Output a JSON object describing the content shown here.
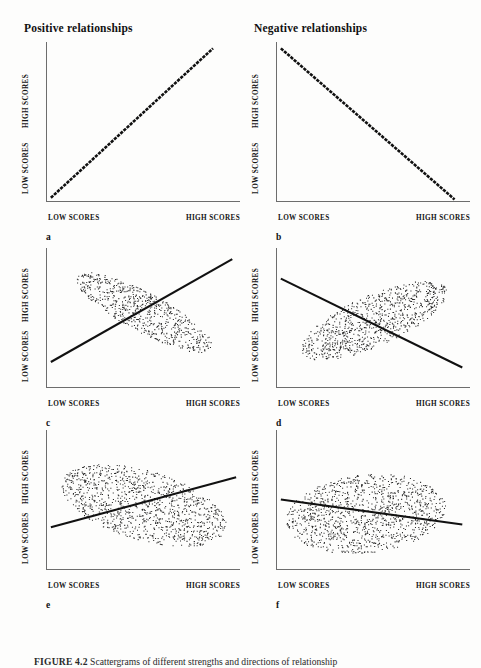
{
  "headings": {
    "left": "Positive relationships",
    "right": "Negative relationships"
  },
  "axis_labels": {
    "x_low": "LOW SCORES",
    "x_high": "HIGH SCORES",
    "y_low": "LOW SCORES",
    "y_high": "HIGH SCORES"
  },
  "caption": {
    "figure_number": "FIGURE 4.2",
    "text": "Scattergrams of different strengths and directions of relationship"
  },
  "panels": [
    {
      "letter": "a",
      "column": "positive",
      "direction": "positive",
      "strength": "perfect"
    },
    {
      "letter": "b",
      "column": "negative",
      "direction": "negative",
      "strength": "perfect"
    },
    {
      "letter": "c",
      "column": "positive",
      "direction": "positive",
      "strength": "strong"
    },
    {
      "letter": "d",
      "column": "negative",
      "direction": "negative",
      "strength": "strong"
    },
    {
      "letter": "e",
      "column": "positive",
      "direction": "positive",
      "strength": "moderate"
    },
    {
      "letter": "f",
      "column": "negative",
      "direction": "negative",
      "strength": "moderate"
    }
  ],
  "colors": {
    "ink": "#111111",
    "axis": "#6d6d6d",
    "paper": "#fdfdfc",
    "dot": "#2a2a2a"
  },
  "chart_data": [
    {
      "type": "scatter",
      "id": "a",
      "title": "Positive relationships",
      "xlabel": "LOW SCORES – HIGH SCORES",
      "ylabel": "LOW SCORES – HIGH SCORES",
      "xlim": [
        0,
        100
      ],
      "ylim": [
        0,
        100
      ],
      "grid": false,
      "legend": null,
      "annotation": "a",
      "trendline": {
        "x": [
          2,
          86
        ],
        "y": [
          2,
          96
        ],
        "style": "dotted-thick"
      },
      "correlation": 1.0,
      "cloud": null
    },
    {
      "type": "scatter",
      "id": "b",
      "title": "Negative relationships",
      "xlabel": "LOW SCORES – HIGH SCORES",
      "ylabel": "LOW SCORES – HIGH SCORES",
      "xlim": [
        0,
        100
      ],
      "ylim": [
        0,
        100
      ],
      "grid": false,
      "legend": null,
      "annotation": "b",
      "trendline": {
        "x": [
          2,
          92
        ],
        "y": [
          96,
          1
        ],
        "style": "dotted-thick"
      },
      "correlation": -1.0,
      "cloud": null
    },
    {
      "type": "scatter",
      "id": "c",
      "xlabel": "LOW SCORES – HIGH SCORES",
      "ylabel": "LOW SCORES – HIGH SCORES",
      "xlim": [
        0,
        100
      ],
      "ylim": [
        0,
        100
      ],
      "grid": false,
      "annotation": "c",
      "trendline": {
        "x": [
          2,
          96
        ],
        "y": [
          18,
          92
        ],
        "style": "solid"
      },
      "correlation": 0.85,
      "cloud": {
        "cx": 50,
        "cy": 54,
        "rx": 44,
        "ry": 13,
        "angle": -38,
        "n": 700
      }
    },
    {
      "type": "scatter",
      "id": "d",
      "xlabel": "LOW SCORES – HIGH SCORES",
      "ylabel": "LOW SCORES – HIGH SCORES",
      "xlim": [
        0,
        100
      ],
      "ylim": [
        0,
        100
      ],
      "grid": false,
      "annotation": "d",
      "trendline": {
        "x": [
          2,
          96
        ],
        "y": [
          78,
          14
        ],
        "style": "solid"
      },
      "correlation": -0.8,
      "cloud": {
        "cx": 50,
        "cy": 48,
        "rx": 44,
        "ry": 17,
        "angle": 34,
        "n": 900
      }
    },
    {
      "type": "scatter",
      "id": "e",
      "xlabel": "LOW SCORES – HIGH SCORES",
      "ylabel": "LOW SCORES – HIGH SCORES",
      "xlim": [
        0,
        100
      ],
      "ylim": [
        0,
        100
      ],
      "grid": false,
      "annotation": "e",
      "trendline": {
        "x": [
          2,
          98
        ],
        "y": [
          30,
          66
        ],
        "style": "solid"
      },
      "correlation": 0.55,
      "cloud": {
        "cx": 50,
        "cy": 46,
        "rx": 46,
        "ry": 24,
        "angle": -26,
        "n": 1150
      }
    },
    {
      "type": "scatter",
      "id": "f",
      "xlabel": "LOW SCORES – HIGH SCORES",
      "ylabel": "LOW SCORES – HIGH SCORES",
      "xlim": [
        0,
        100
      ],
      "ylim": [
        0,
        100
      ],
      "grid": false,
      "annotation": "f",
      "trendline": {
        "x": [
          2,
          96
        ],
        "y": [
          50,
          32
        ],
        "style": "solid"
      },
      "correlation": -0.3,
      "cloud": {
        "cx": 46,
        "cy": 40,
        "rx": 42,
        "ry": 28,
        "angle": 12,
        "n": 1200
      }
    }
  ]
}
